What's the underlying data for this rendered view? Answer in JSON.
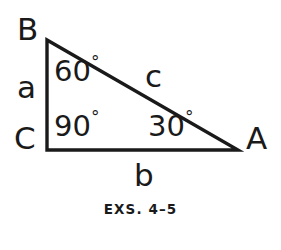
{
  "figure": {
    "type": "right-triangle-diagram",
    "caption": "EXS. 4–5",
    "line_color": "#1a1a1a",
    "background_color": "#ffffff",
    "vertices": [
      {
        "name": "B",
        "label": "B",
        "x": 47,
        "y": 40
      },
      {
        "name": "C",
        "label": "C",
        "x": 47,
        "y": 150
      },
      {
        "name": "A",
        "label": "A",
        "x": 238,
        "y": 150
      }
    ],
    "sides": [
      {
        "name": "a",
        "label": "a",
        "between": "B-C"
      },
      {
        "name": "b",
        "label": "b",
        "between": "C-A"
      },
      {
        "name": "c",
        "label": "c",
        "between": "B-A"
      }
    ],
    "angles": [
      {
        "at": "B",
        "value": "60",
        "degree_symbol": "°",
        "label": "60°"
      },
      {
        "at": "C",
        "value": "90",
        "degree_symbol": "°",
        "label": "90°"
      },
      {
        "at": "A",
        "value": "30",
        "degree_symbol": "°",
        "label": "30°"
      }
    ],
    "labels": {
      "vertex_b": "B",
      "vertex_c": "C",
      "vertex_a": "A",
      "side_a": "a",
      "side_b": "b",
      "side_c": "c",
      "angle_b_value": "60",
      "angle_c_value": "90",
      "angle_a_value": "30",
      "degree_symbol": "°"
    }
  }
}
